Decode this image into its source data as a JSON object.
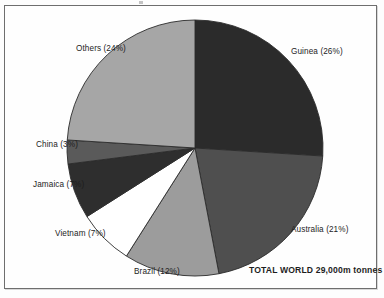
{
  "figure": {
    "annotation": "TOTAL WORLD 29,000m tonnes",
    "background_color": "#fdfdfd",
    "frame_color": "#6e6e6e"
  },
  "chart_data": {
    "type": "pie",
    "title": "",
    "subtitle": "",
    "annotation": "TOTAL WORLD 29,000m tonnes",
    "total_label": "TOTAL WORLD 29,000m tonnes",
    "total_value": "29,000m tonnes",
    "unit": "m tonnes",
    "value_suffix": "%",
    "start_angle_deg": 0,
    "direction": "clockwise",
    "legend": "none",
    "grid": false,
    "categories": [
      "Guinea",
      "Australia",
      "Brazil",
      "Vietnam",
      "Jamaica",
      "China",
      "Others"
    ],
    "values": [
      26,
      21,
      12,
      7,
      7,
      3,
      24
    ],
    "colors": [
      "#2b2b2b",
      "#4f4f4f",
      "#9c9c9c",
      "#ffffff",
      "#2e2e2e",
      "#5a5a5a",
      "#a6a6a6"
    ],
    "slices": [
      {
        "label": "Guinea",
        "value": 26,
        "text": "Guinea (26%)",
        "color": "#2b2b2b"
      },
      {
        "label": "Australia",
        "value": 21,
        "text": "Australia (21%)",
        "color": "#4f4f4f"
      },
      {
        "label": "Brazil",
        "value": 12,
        "text": "Brazil (12%)",
        "color": "#9c9c9c"
      },
      {
        "label": "Vietnam",
        "value": 7,
        "text": "Vietnam (7%)",
        "color": "#ffffff"
      },
      {
        "label": "Jamaica",
        "value": 7,
        "text": "Jamaica (7%)",
        "color": "#2e2e2e"
      },
      {
        "label": "China",
        "value": 3,
        "text": "China (3%)",
        "color": "#5a5a5a"
      },
      {
        "label": "Others",
        "value": 24,
        "text": "Others (24%)",
        "color": "#a6a6a6"
      }
    ]
  }
}
